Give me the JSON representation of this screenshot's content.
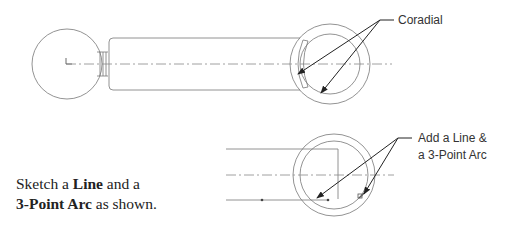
{
  "callouts": {
    "top": {
      "text": "Coradial"
    },
    "bottom": {
      "line1": "Add a Line &",
      "line2": "a 3-Point Arc"
    }
  },
  "instruction": {
    "part1": "Sketch a ",
    "bold1": "Line",
    "part2": " and a",
    "bold2": "3-Point Arc",
    "part3": " as shown."
  },
  "colors": {
    "line": "#777777",
    "leader": "#222222",
    "text": "#333333"
  }
}
